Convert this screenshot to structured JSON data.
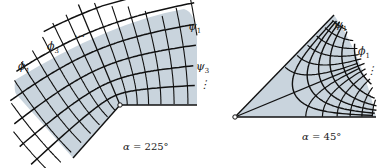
{
  "colors": {
    "region_fill": "#c9d4dd",
    "line": "#111111",
    "background": "#ffffff"
  },
  "left_panel": {
    "name": "corner-225",
    "caption": {
      "symbol": "α",
      "equals": " = ",
      "value": "225°"
    },
    "labels": {
      "phi_first": {
        "symbol": "ϕ",
        "sub": "1"
      },
      "phi_third": {
        "symbol": "ϕ",
        "sub": "3"
      },
      "phi_ellipsis": "…",
      "psi_first": {
        "symbol": "ψ",
        "sub": "1"
      },
      "psi_third": {
        "symbol": "ψ",
        "sub": "3"
      },
      "psi_ellipsis": "⋮"
    }
  },
  "right_panel": {
    "name": "wedge-45",
    "caption": {
      "symbol": "α",
      "equals": " = ",
      "value": "45°"
    },
    "labels": {
      "psi_first": {
        "symbol": "ψ",
        "sub": "1"
      },
      "phi_first": {
        "symbol": "ϕ",
        "sub": "1"
      },
      "phi_ellipsis": "⋮"
    }
  }
}
